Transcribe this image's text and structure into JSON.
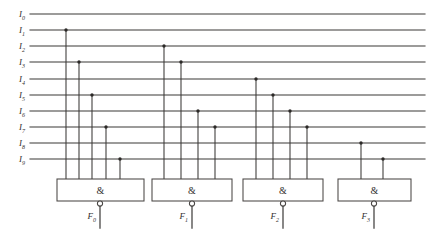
{
  "diagram": {
    "colors": {
      "line": "#3a3836",
      "gate_stroke": "#4a4745",
      "gate_fill": "#ffffff",
      "background": "#ffffff",
      "dot": "#2b2927"
    },
    "geometry": {
      "line_x_start": 30,
      "line_x_end": 425,
      "row_y_start": 14,
      "row_spacing": 16.2,
      "gate_top": 179,
      "gate_height": 22,
      "bubble_radius": 2.6,
      "output_stub_length": 22
    },
    "inputs": [
      {
        "id": "I0",
        "base": "I",
        "sub": "0",
        "y": 14
      },
      {
        "id": "I1",
        "base": "I",
        "sub": "1",
        "y": 30
      },
      {
        "id": "I2",
        "base": "I",
        "sub": "2",
        "y": 46
      },
      {
        "id": "I3",
        "base": "I",
        "sub": "3",
        "y": 62
      },
      {
        "id": "I4",
        "base": "I",
        "sub": "4",
        "y": 79
      },
      {
        "id": "I5",
        "base": "I",
        "sub": "5",
        "y": 95
      },
      {
        "id": "I6",
        "base": "I",
        "sub": "6",
        "y": 111
      },
      {
        "id": "I7",
        "base": "I",
        "sub": "7",
        "y": 127
      },
      {
        "id": "I8",
        "base": "I",
        "sub": "8",
        "y": 143
      },
      {
        "id": "I9",
        "base": "I",
        "sub": "9",
        "y": 159
      }
    ],
    "gates": [
      {
        "id": "gate-0",
        "symbol": "&",
        "box_x": 57,
        "box_w": 87,
        "output": {
          "base": "F",
          "sub": "0",
          "x": 100
        },
        "connections": [
          {
            "input": "I1",
            "x": 66,
            "y": 30
          },
          {
            "input": "I3",
            "x": 79,
            "y": 62
          },
          {
            "input": "I5",
            "x": 92,
            "y": 95
          },
          {
            "input": "I7",
            "x": 106,
            "y": 127
          },
          {
            "input": "I9",
            "x": 120,
            "y": 159
          }
        ]
      },
      {
        "id": "gate-1",
        "symbol": "&",
        "box_x": 152,
        "box_w": 80,
        "output": {
          "base": "F",
          "sub": "1",
          "x": 192
        },
        "connections": [
          {
            "input": "I2",
            "x": 164,
            "y": 46
          },
          {
            "input": "I3",
            "x": 181,
            "y": 62
          },
          {
            "input": "I6",
            "x": 198,
            "y": 111
          },
          {
            "input": "I7",
            "x": 215,
            "y": 127
          }
        ]
      },
      {
        "id": "gate-2",
        "symbol": "&",
        "box_x": 243,
        "box_w": 80,
        "output": {
          "base": "F",
          "sub": "2",
          "x": 283
        },
        "connections": [
          {
            "input": "I4",
            "x": 256,
            "y": 79
          },
          {
            "input": "I5",
            "x": 273,
            "y": 95
          },
          {
            "input": "I6",
            "x": 290,
            "y": 111
          },
          {
            "input": "I7",
            "x": 307,
            "y": 127
          }
        ]
      },
      {
        "id": "gate-3",
        "symbol": "&",
        "box_x": 338,
        "box_w": 73,
        "output": {
          "base": "F",
          "sub": "3",
          "x": 374
        },
        "connections": [
          {
            "input": "I8",
            "x": 361,
            "y": 143
          },
          {
            "input": "I9",
            "x": 383,
            "y": 159
          }
        ]
      }
    ]
  }
}
